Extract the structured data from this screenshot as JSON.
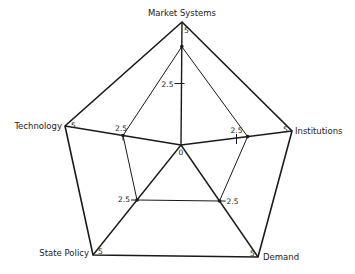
{
  "chart_data": {
    "type": "radar",
    "title": "",
    "scale": {
      "min": 0,
      "max": 5,
      "ticks": [
        0,
        2.5,
        5
      ]
    },
    "center_label": "0",
    "grid": false,
    "legend": null,
    "axes": [
      {
        "name": "Market Systems",
        "max_label": "5",
        "mid_label": "2.5"
      },
      {
        "name": "Institutions",
        "max_label": "5",
        "mid_label": "2.5"
      },
      {
        "name": "Demand",
        "max_label": "5",
        "mid_label": "2.5"
      },
      {
        "name": "State Policy",
        "max_label": "5",
        "mid_label": "2.5"
      },
      {
        "name": "Technology",
        "max_label": "5",
        "mid_label": "2.5"
      }
    ],
    "series": [
      {
        "name": "Profile",
        "values": [
          4.0,
          3.0,
          2.5,
          2.5,
          2.5
        ]
      }
    ],
    "colors": {
      "line": "#1a1a1a",
      "background": "#ffffff"
    }
  },
  "layout": {
    "center": [
      181,
      145
    ],
    "vertices": [
      [
        182,
        22
      ],
      [
        292,
        131
      ],
      [
        258,
        257
      ],
      [
        93,
        255
      ],
      [
        65,
        126
      ]
    ]
  }
}
